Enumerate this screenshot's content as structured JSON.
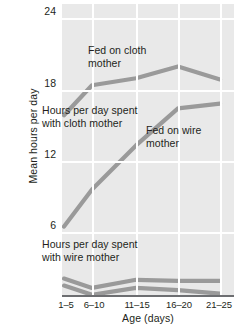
{
  "chart_data": {
    "type": "line",
    "title": "",
    "xlabel": "Age (days)",
    "ylabel": "Mean hours per day",
    "categories": [
      "1–5",
      "6–10",
      "11–15",
      "16–20",
      "21–25"
    ],
    "yticks": [
      24,
      18,
      12,
      6
    ],
    "ylim": [
      0,
      24.6
    ],
    "grid": true,
    "legend": "annotations",
    "series": [
      {
        "name": "Hours per day spent with cloth mother, fed on cloth mother",
        "values": [
          15.6,
          18.2,
          18.8,
          19.8,
          18.7
        ],
        "color": "#9a9a9a"
      },
      {
        "name": "Hours per day spent with cloth mother, fed on wire mother",
        "values": [
          6.0,
          9.2,
          13.0,
          16.2,
          16.6
        ],
        "color": "#9a9a9a"
      },
      {
        "name": "Hours per day spent with wire mother, fed on wire mother",
        "values": [
          1.5,
          0.7,
          1.4,
          1.3,
          1.3
        ],
        "color": "#9a9a9a"
      },
      {
        "name": "Hours per day spent with wire mother, fed on cloth mother",
        "values": [
          0.9,
          0.1,
          0.7,
          0.5,
          0.2
        ],
        "color": "#9a9a9a"
      }
    ],
    "annotations": [
      {
        "id": "fed-on-cloth-mother",
        "text": "Fed on cloth mother"
      },
      {
        "id": "hours-cloth-mother",
        "text": "Hours per day spent with cloth mother"
      },
      {
        "id": "fed-on-wire-mother",
        "text": "Fed on wire mother"
      },
      {
        "id": "hours-wire-mother",
        "text": "Hours per day spent with wire mother"
      }
    ]
  },
  "axis": {
    "ylabel": "Mean hours per day",
    "xlabel": "Age (days)",
    "ytick_0": "24",
    "ytick_1": "18",
    "ytick_2": "12",
    "ytick_3": "6",
    "xtick_0": "1–5",
    "xtick_1": "6–10",
    "xtick_2": "11–15",
    "xtick_3": "16–20",
    "xtick_4": "21–25"
  },
  "annotations": {
    "fed_cloth": "Fed on cloth mother",
    "hours_cloth": "Hours per day spent with cloth mother",
    "fed_wire": "Fed on wire mother",
    "hours_wire": "Hours per day spent with wire mother"
  },
  "colors": {
    "plot_background": "#e9e9e9",
    "gridline": "#ffffff",
    "line": "#9a9a9a",
    "axis": "#6d6e71",
    "text": "#231f20"
  }
}
